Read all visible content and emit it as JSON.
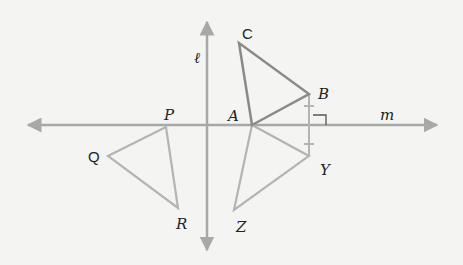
{
  "colors": {
    "background": "#f4f4f2",
    "axis": "#a8a8a8",
    "original_triangle": "#8a8a8a",
    "image_triangle": "#b4b4b4",
    "label": "#222222"
  },
  "lines": {
    "l": {
      "label": "ℓ",
      "x": 207,
      "y_top": 22,
      "y_bottom": 250
    },
    "m": {
      "label": "m",
      "y": 125,
      "x_left": 28,
      "x_right": 437
    }
  },
  "triangles": {
    "ABC": {
      "A": [
        252,
        125
      ],
      "B": [
        309,
        94
      ],
      "C": [
        239,
        43
      ]
    },
    "AYZ": {
      "A": [
        252,
        125
      ],
      "Y": [
        309,
        156
      ],
      "Z": [
        234,
        210
      ]
    },
    "PQR": {
      "P": [
        166,
        127
      ],
      "Q": [
        108,
        156
      ],
      "R": [
        178,
        208
      ]
    }
  },
  "labels": {
    "C": "C",
    "B": "B",
    "A": "A",
    "Y": "Y",
    "Z": "Z",
    "P": "P",
    "Q": "Q",
    "R": "R",
    "l": "ℓ",
    "m": "m"
  }
}
